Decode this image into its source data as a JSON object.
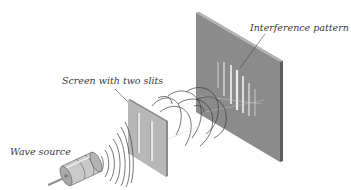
{
  "diagram": {
    "labels": {
      "wave_source": "Wave source",
      "slit_screen": "Screen with two slits",
      "interference": "Interference pattern"
    },
    "colors": {
      "background": "#ffffff",
      "detector_screen": "#8f8f8f",
      "detector_edge": "#5e5e5e",
      "slit_screen": "#bdbdbd",
      "slit_screen_edge": "#8a8a8a",
      "slit": "#e6e6e6",
      "fringe": "#e9e9e9",
      "wave": "#3c3c3c",
      "source_body": "#c9c9c9",
      "label_text": "#3a3a3a"
    },
    "components": [
      {
        "name": "wave-source",
        "type": "cylinder"
      },
      {
        "name": "slit-screen",
        "slit_count": 2
      },
      {
        "name": "detector-screen",
        "fringe_count": 7
      }
    ]
  }
}
